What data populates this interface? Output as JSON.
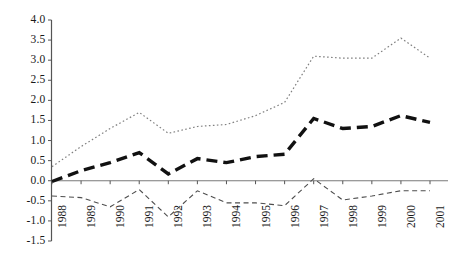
{
  "chart_data": {
    "type": "line",
    "title": "",
    "subtitle": "",
    "xlabel": "",
    "ylabel": "",
    "categories": [
      "1988",
      "1989",
      "1990",
      "1991",
      "1992",
      "1993",
      "1994",
      "1995",
      "1996",
      "1997",
      "1998",
      "1999",
      "2000",
      "2001"
    ],
    "x": [
      1988,
      1989,
      1990,
      1991,
      1992,
      1993,
      1994,
      1995,
      1996,
      1997,
      1998,
      1999,
      2000,
      2001
    ],
    "ylim": [
      -1.5,
      4.0
    ],
    "ytick_labels": [
      "4.0",
      "3.5",
      "3.0",
      "2.5",
      "2.0",
      "1.5",
      "1.0",
      "0.5",
      "0.0",
      "-0.5",
      "-1.0",
      "-1.5"
    ],
    "ytick_values": [
      4.0,
      3.5,
      3.0,
      2.5,
      2.0,
      1.5,
      1.0,
      0.5,
      0.0,
      -0.5,
      -1.0,
      -1.5
    ],
    "ytick_step": 0.5,
    "grid": false,
    "legend_position": "none",
    "zero_line": true,
    "series": [
      {
        "name": "upper-series",
        "style": "dotted",
        "color": "#808080",
        "width": 1.2,
        "values": [
          0.35,
          0.85,
          1.3,
          1.7,
          1.18,
          1.35,
          1.4,
          1.62,
          1.95,
          3.1,
          3.05,
          3.05,
          3.55,
          3.05
        ]
      },
      {
        "name": "middle-series",
        "style": "thick-dashed",
        "color": "#111111",
        "width": 3.4,
        "values": [
          -0.02,
          0.25,
          0.45,
          0.7,
          0.17,
          0.55,
          0.45,
          0.6,
          0.66,
          1.55,
          1.3,
          1.35,
          1.62,
          1.45
        ]
      },
      {
        "name": "lower-series",
        "style": "thin-dashed",
        "color": "#4d4d4d",
        "width": 1.1,
        "values": [
          -0.38,
          -0.42,
          -0.65,
          -0.22,
          -0.9,
          -0.25,
          -0.55,
          -0.55,
          -0.62,
          0.05,
          -0.48,
          -0.38,
          -0.25,
          -0.25
        ]
      }
    ]
  },
  "axes": {
    "y_axis_color": "#555555",
    "zero_line_color": "#7a7a7a",
    "tick_color": "#555555"
  }
}
